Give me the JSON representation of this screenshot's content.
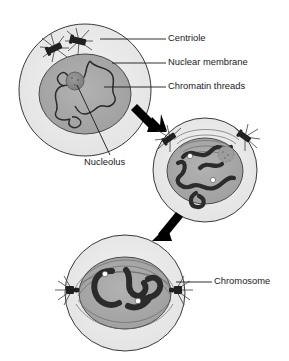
{
  "figure": {
    "title_fragment": "",
    "background_color": "#ffffff",
    "width": 289,
    "height": 361
  },
  "colors": {
    "cytoplasm": "#e9e9e9",
    "nucleoplasm": "#a8a8a8",
    "nucleolus": "#8a8a8a",
    "chromatin": "#2b2b2b",
    "centriole": "#202020",
    "centromere": "#ffffff",
    "outline": "#3a3a3a",
    "label_text": "#1a1a1a",
    "arrow": "#000000"
  },
  "labels": [
    {
      "id": "centriole",
      "text": "Centriole",
      "text_x": 168,
      "text_y": 39,
      "leader_from_x": 100,
      "leader_from_y": 39,
      "leader_to_x": 166,
      "leader_to_y": 39
    },
    {
      "id": "nuclear-membrane",
      "text": "Nuclear membrane",
      "text_x": 168,
      "text_y": 63,
      "leader_from_x": 112,
      "leader_from_y": 63,
      "leader_to_x": 166,
      "leader_to_y": 63
    },
    {
      "id": "chromatin-threads",
      "text": "Chromatin threads",
      "text_x": 168,
      "text_y": 87,
      "leader_from_x": 104,
      "leader_from_y": 87,
      "leader_to_x": 166,
      "leader_to_y": 87
    },
    {
      "id": "nucleolus",
      "text": "Nucleolus",
      "text_x": 84,
      "text_y": 163,
      "leader_from_x": 77,
      "leader_from_y": 85,
      "leader_to_x": 110,
      "leader_to_y": 155
    },
    {
      "id": "chromosome",
      "text": "Chromosome",
      "text_x": 214,
      "text_y": 282,
      "leader_from_x": 176,
      "leader_from_y": 282,
      "leader_to_x": 212,
      "leader_to_y": 282
    }
  ],
  "cells": [
    {
      "id": "cell-early-prophase",
      "stage": "Early prophase",
      "cx": 85,
      "cy": 90,
      "cell_rx": 66,
      "cell_ry": 66,
      "nucleus_rx": 46,
      "nucleus_ry": 40,
      "nucleus_cx": 85,
      "nucleus_cy": 94,
      "has_nucleolus": true,
      "nucleolus_cx": 75,
      "nucleolus_cy": 81,
      "nucleolus_r": 9,
      "centriole_count": 2,
      "centrioles": [
        {
          "x": 55,
          "y": 48,
          "angle": -25
        },
        {
          "x": 78,
          "y": 41,
          "angle": 12
        }
      ]
    },
    {
      "id": "cell-mid-prophase",
      "stage": "Mid prophase",
      "cx": 205,
      "cy": 170,
      "cell_rx": 52,
      "cell_ry": 52,
      "nucleus_rx": 38,
      "nucleus_ry": 33,
      "nucleus_cx": 205,
      "nucleus_cy": 171,
      "has_nucleolus": true,
      "nucleolus_cx": 226,
      "nucleolus_cy": 154,
      "nucleolus_r": 8,
      "centriole_count": 2,
      "centrioles": [
        {
          "x": 170,
          "y": 138,
          "angle": -35
        },
        {
          "x": 245,
          "y": 137,
          "angle": 35
        }
      ]
    },
    {
      "id": "cell-late-prophase",
      "stage": "Late prophase",
      "cx": 125,
      "cy": 293,
      "cell_rx": 60,
      "cell_ry": 58,
      "nucleus_rx": 46,
      "nucleus_ry": 36,
      "nucleus_cx": 125,
      "nucleus_cy": 293,
      "has_nucleolus": false,
      "centriole_count": 2,
      "centrioles": [
        {
          "x": 72,
          "y": 290,
          "angle": 0
        },
        {
          "x": 176,
          "y": 290,
          "angle": 0
        }
      ]
    }
  ],
  "arrows": [
    {
      "id": "arrow-stage1-to-stage2",
      "from_x": 139,
      "from_y": 107,
      "to_x": 163,
      "to_y": 128,
      "direction": "down-right"
    },
    {
      "id": "arrow-stage2-to-stage3",
      "from_x": 175,
      "from_y": 214,
      "to_x": 156,
      "to_y": 238,
      "direction": "down-left"
    }
  ],
  "centromeres": [
    {
      "cell": "cell-mid-prophase",
      "x": 190,
      "y": 156,
      "r": 2.6
    },
    {
      "cell": "cell-mid-prophase",
      "x": 213,
      "y": 180,
      "r": 2.6
    },
    {
      "cell": "cell-late-prophase",
      "x": 105,
      "y": 274,
      "r": 2.8
    },
    {
      "cell": "cell-late-prophase",
      "x": 138,
      "y": 301,
      "r": 2.8
    }
  ]
}
